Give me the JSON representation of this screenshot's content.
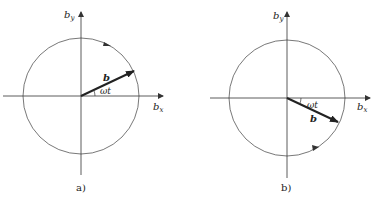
{
  "diagrams": [
    {
      "id": "a",
      "caption": "a)",
      "x_axis_label": "b",
      "x_axis_sub": "x",
      "y_axis_label": "b",
      "y_axis_sub": "y",
      "vector_label": "b",
      "angle_label": "ωt",
      "rotation": "counterclockwise",
      "vector_direction": "upper-right"
    },
    {
      "id": "b",
      "caption": "b)",
      "x_axis_label": "b",
      "x_axis_sub": "x",
      "y_axis_label": "b",
      "y_axis_sub": "y",
      "vector_label": "b",
      "angle_label": "ωt",
      "rotation": "clockwise",
      "vector_direction": "lower-right"
    }
  ],
  "colors": {
    "stroke": "#333333",
    "background": "#ffffff"
  }
}
